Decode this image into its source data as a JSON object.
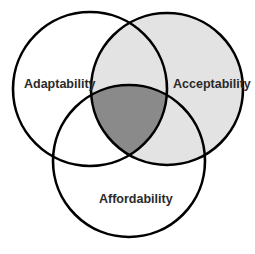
{
  "diagram": {
    "type": "venn",
    "sets": [
      {
        "id": "adaptability",
        "label": "Adaptability",
        "cx": 90,
        "cy": 89,
        "r": 77
      },
      {
        "id": "acceptability",
        "label": "Acceptability",
        "cx": 167,
        "cy": 89,
        "r": 76
      },
      {
        "id": "affordability",
        "label": "Affordability",
        "cx": 129,
        "cy": 161,
        "r": 76
      }
    ],
    "colors": {
      "acceptability_fill": "#e3e3e3",
      "triple_intersection_fill": "#8a8a8a",
      "stroke": "#000000",
      "background": "#ffffff"
    },
    "highlighted_regions": [
      {
        "region": "acceptability",
        "fill": "light-gray"
      },
      {
        "region": "adaptability-acceptability-affordability",
        "fill": "dark-gray"
      }
    ]
  }
}
